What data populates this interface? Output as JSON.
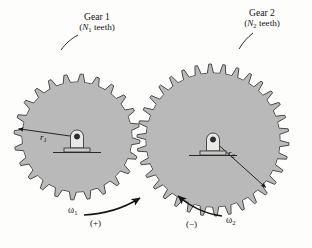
{
  "figure": {
    "background_color": "#fdfdfc",
    "gear_fill_color": "#b9b9b9",
    "gear_outline_color": "#4a4a4a",
    "line_color": "#1a1a1a"
  },
  "gear1": {
    "label": "Gear 1",
    "teeth_label_open": "(",
    "teeth_symbol": "N",
    "teeth_subscript": "1",
    "teeth_label_close": " teeth)",
    "radius_symbol": "r",
    "radius_subscript": "1",
    "tooth_count": 24,
    "center_x": 77,
    "center_y": 137,
    "outer_radius": 63,
    "root_radius": 55
  },
  "gear2": {
    "label": "Gear 2",
    "teeth_label_open": "(",
    "teeth_symbol": "N",
    "teeth_subscript": "2",
    "teeth_label_close": " teeth)",
    "radius_symbol": "r",
    "radius_subscript": "2",
    "tooth_count": 34,
    "center_x": 213,
    "center_y": 140,
    "outer_radius": 76,
    "root_radius": 67
  },
  "omega1": {
    "symbol": "ω",
    "subscript": "1",
    "sign": "(+)",
    "direction": "clockwise"
  },
  "omega2": {
    "symbol": "ω",
    "subscript": "2",
    "sign": "(−)",
    "direction": "counterclockwise"
  }
}
